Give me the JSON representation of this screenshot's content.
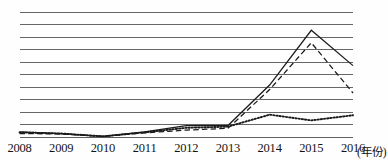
{
  "chart_data": {
    "type": "line",
    "title": "",
    "subtitle": "",
    "xlabel": "(年份)",
    "ylabel": "",
    "categories": [
      "2008",
      "2009",
      "2010",
      "2011",
      "2012",
      "2013",
      "2014",
      "2015",
      "2016"
    ],
    "x": [
      2008,
      2009,
      2010,
      2011,
      2012,
      2013,
      2014,
      2015,
      2016
    ],
    "ylim": [
      0,
      11
    ],
    "xlim": [
      2008,
      2016
    ],
    "grid": true,
    "gridlines_count": 11,
    "legend": false,
    "legend_position": "none",
    "y_tick_labels": [],
    "series": [
      {
        "name": "series-solid",
        "style": "solid",
        "color": "#1a1a1a",
        "values": [
          0.5,
          0.35,
          0.1,
          0.5,
          1.05,
          1.05,
          4.6,
          9.4,
          6.3
        ]
      },
      {
        "name": "series-dashed",
        "style": "dashed",
        "color": "#1a1a1a",
        "values": [
          0.35,
          0.3,
          0.1,
          0.4,
          0.65,
          0.8,
          4.2,
          8.3,
          3.9
        ]
      },
      {
        "name": "series-dotted",
        "style": "dotted",
        "color": "#1a1a1a",
        "values": [
          0.45,
          0.35,
          0.1,
          0.45,
          0.85,
          0.95,
          2.0,
          1.5,
          1.95
        ]
      }
    ],
    "annotations": []
  },
  "axis": {
    "unit_label": "(年份)"
  },
  "colors": {
    "grid": "#5f5f5f",
    "ink": "#1a1a1a",
    "background": "#fefefe"
  }
}
